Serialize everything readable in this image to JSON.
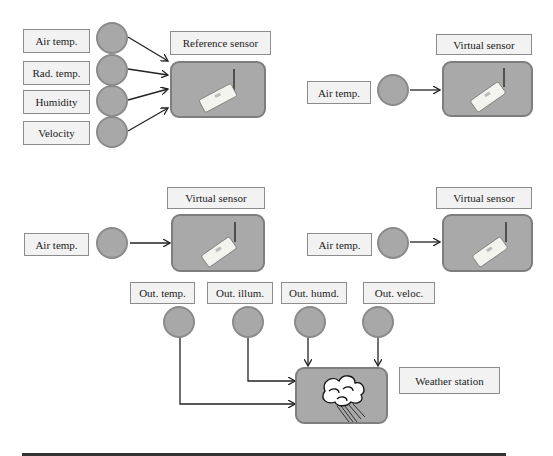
{
  "diagram": {
    "panel_a": {
      "inputs": [
        "Air temp.",
        "Rad. temp.",
        "Humidity",
        "Velocity"
      ],
      "target_label": "Reference sensor"
    },
    "panel_b": {
      "input": "Air temp.",
      "target_label": "Virtual sensor"
    },
    "panel_c": {
      "input": "Air temp.",
      "target_label": "Virtual sensor"
    },
    "panel_d": {
      "input": "Air temp.",
      "target_label": "Virtual sensor"
    },
    "weather": {
      "inputs": [
        "Out. temp.",
        "Out. illum.",
        "Out. humd.",
        "Out. veloc."
      ],
      "target_label": "Weather station"
    },
    "icons": {
      "sensor": "wireless-sensor-icon",
      "weather": "rain-cloud-icon"
    },
    "colors": {
      "node_fill": "#a8a8a8",
      "box_fill": "#a9a9a9",
      "label_fill": "#f2f2f2",
      "line": "#222222"
    }
  }
}
